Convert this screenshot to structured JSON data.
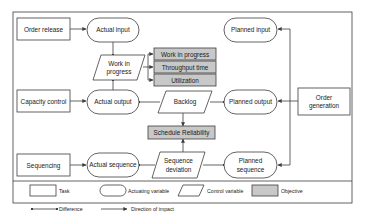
{
  "diagram": {
    "tasks": {
      "order_release": "Order release",
      "capacity_control": "Capacity control",
      "sequencing": "Sequencing",
      "order_generation_line1": "Order",
      "order_generation_line2": "generation"
    },
    "actuating_variables": {
      "actual_input": "Actual input",
      "actual_output": "Actual output",
      "actual_sequence": "Actual sequence",
      "planned_input": "Planned input",
      "planned_output": "Planned output",
      "planned_sequence_line1": "Planned",
      "planned_sequence_line2": "sequence"
    },
    "control_variables": {
      "wip_line1": "Work in",
      "wip_line2": "progress",
      "backlog": "Backlog",
      "seq_dev_line1": "Sequence",
      "seq_dev_line2": "deviation"
    },
    "objectives": {
      "work_in_progress": "Work in progress",
      "throughput_time": "Throughput time",
      "utilization": "Utilization",
      "schedule_reliability": "Schedule Reliability"
    },
    "colors": {
      "objective_fill": "#c8c8c8",
      "stroke": "#3c3c3c"
    }
  },
  "legend": {
    "task": "Task",
    "actuating_variable": "Actuating variable",
    "control_variable": "Control variable",
    "objective": "Objective",
    "difference": "Difference",
    "direction_of_impact": "Direction of impact"
  }
}
